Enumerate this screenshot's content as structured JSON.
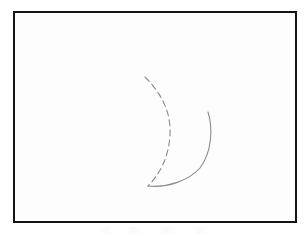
{
  "figure": {
    "background_color": "#fdfdfd",
    "page_color": "#ffffff",
    "frame": {
      "name": "rectangular border",
      "color": "#141414",
      "stroke_width": 2.5,
      "x": 13,
      "y": 11,
      "width": 284,
      "height": 212
    },
    "shapes": [
      {
        "id": "inner-arc",
        "name": "dashed inner arc",
        "style": "dashed",
        "stroke_color": "#8a8a8a",
        "stroke_width": 1.1,
        "dash_pattern": "6 4",
        "start_point": [
          145,
          77
        ],
        "end_point": [
          148,
          186
        ],
        "apex_point": [
          171,
          131
        ],
        "path": "M145,77 C160,92 171,110 170,134 C169,158 159,175 148,186"
      },
      {
        "id": "outer-arc",
        "name": "solid outer arc",
        "style": "solid",
        "stroke_color": "#8a8a8a",
        "stroke_width": 1.1,
        "dash_pattern": "none",
        "start_point": [
          208,
          112
        ],
        "end_point": [
          148,
          186
        ],
        "apex_point": [
          211,
          146
        ],
        "path": "M208,112 C213,128 212,152 200,168 C188,181 167,188 148,186"
      }
    ],
    "annotations": [],
    "labels": [],
    "caption": ""
  }
}
